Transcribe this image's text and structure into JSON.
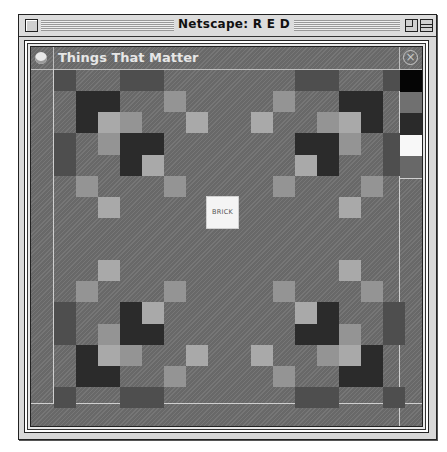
{
  "window": {
    "title": "Netscape: R E D"
  },
  "panel": {
    "title": "Things That Matter",
    "center_button_label": "BRICK"
  },
  "colors": {
    "dark": "#2b2b2b",
    "medium_dark": "#4e4e4e",
    "light_mid": "#949494",
    "light": "#a9a9a9",
    "background": "#6e6e6e"
  },
  "swatches": [
    "#050505",
    "#707070",
    "#2a2a2a",
    "#f8f8f8",
    "#686868"
  ],
  "grid": {
    "columns": 16,
    "rows": 16,
    "cells": [
      [
        0,
        0,
        "mdark"
      ],
      [
        0,
        3,
        "mdark"
      ],
      [
        0,
        4,
        "mdark"
      ],
      [
        0,
        11,
        "mdark"
      ],
      [
        0,
        12,
        "mdark"
      ],
      [
        0,
        15,
        "mdark"
      ],
      [
        1,
        1,
        "dark"
      ],
      [
        1,
        2,
        "dark"
      ],
      [
        1,
        5,
        "lmid"
      ],
      [
        1,
        10,
        "lmid"
      ],
      [
        1,
        13,
        "dark"
      ],
      [
        1,
        14,
        "dark"
      ],
      [
        2,
        1,
        "dark"
      ],
      [
        2,
        2,
        "light"
      ],
      [
        2,
        3,
        "lmid"
      ],
      [
        2,
        6,
        "light"
      ],
      [
        2,
        9,
        "light"
      ],
      [
        2,
        12,
        "lmid"
      ],
      [
        2,
        13,
        "light"
      ],
      [
        2,
        14,
        "dark"
      ],
      [
        3,
        0,
        "mdark"
      ],
      [
        3,
        2,
        "lmid"
      ],
      [
        3,
        3,
        "dark"
      ],
      [
        3,
        4,
        "dark"
      ],
      [
        3,
        11,
        "dark"
      ],
      [
        3,
        12,
        "dark"
      ],
      [
        3,
        13,
        "lmid"
      ],
      [
        3,
        15,
        "mdark"
      ],
      [
        4,
        0,
        "mdark"
      ],
      [
        4,
        3,
        "dark"
      ],
      [
        4,
        4,
        "light"
      ],
      [
        4,
        11,
        "light"
      ],
      [
        4,
        12,
        "dark"
      ],
      [
        4,
        15,
        "mdark"
      ],
      [
        5,
        1,
        "lmid"
      ],
      [
        5,
        5,
        "lmid"
      ],
      [
        5,
        10,
        "lmid"
      ],
      [
        5,
        14,
        "lmid"
      ],
      [
        6,
        2,
        "light"
      ],
      [
        6,
        13,
        "light"
      ],
      [
        9,
        2,
        "light"
      ],
      [
        9,
        13,
        "light"
      ],
      [
        10,
        1,
        "lmid"
      ],
      [
        10,
        5,
        "lmid"
      ],
      [
        10,
        10,
        "lmid"
      ],
      [
        10,
        14,
        "lmid"
      ],
      [
        11,
        0,
        "mdark"
      ],
      [
        11,
        3,
        "dark"
      ],
      [
        11,
        4,
        "light"
      ],
      [
        11,
        11,
        "light"
      ],
      [
        11,
        12,
        "dark"
      ],
      [
        11,
        15,
        "mdark"
      ],
      [
        12,
        0,
        "mdark"
      ],
      [
        12,
        2,
        "lmid"
      ],
      [
        12,
        3,
        "dark"
      ],
      [
        12,
        4,
        "dark"
      ],
      [
        12,
        11,
        "dark"
      ],
      [
        12,
        12,
        "dark"
      ],
      [
        12,
        13,
        "lmid"
      ],
      [
        12,
        15,
        "mdark"
      ],
      [
        13,
        1,
        "dark"
      ],
      [
        13,
        2,
        "light"
      ],
      [
        13,
        3,
        "lmid"
      ],
      [
        13,
        6,
        "light"
      ],
      [
        13,
        9,
        "light"
      ],
      [
        13,
        12,
        "lmid"
      ],
      [
        13,
        13,
        "light"
      ],
      [
        13,
        14,
        "dark"
      ],
      [
        14,
        1,
        "dark"
      ],
      [
        14,
        2,
        "dark"
      ],
      [
        14,
        5,
        "lmid"
      ],
      [
        14,
        10,
        "lmid"
      ],
      [
        14,
        13,
        "dark"
      ],
      [
        14,
        14,
        "dark"
      ],
      [
        15,
        0,
        "mdark"
      ],
      [
        15,
        3,
        "mdark"
      ],
      [
        15,
        4,
        "mdark"
      ],
      [
        15,
        11,
        "mdark"
      ],
      [
        15,
        12,
        "mdark"
      ],
      [
        15,
        15,
        "mdark"
      ]
    ]
  }
}
